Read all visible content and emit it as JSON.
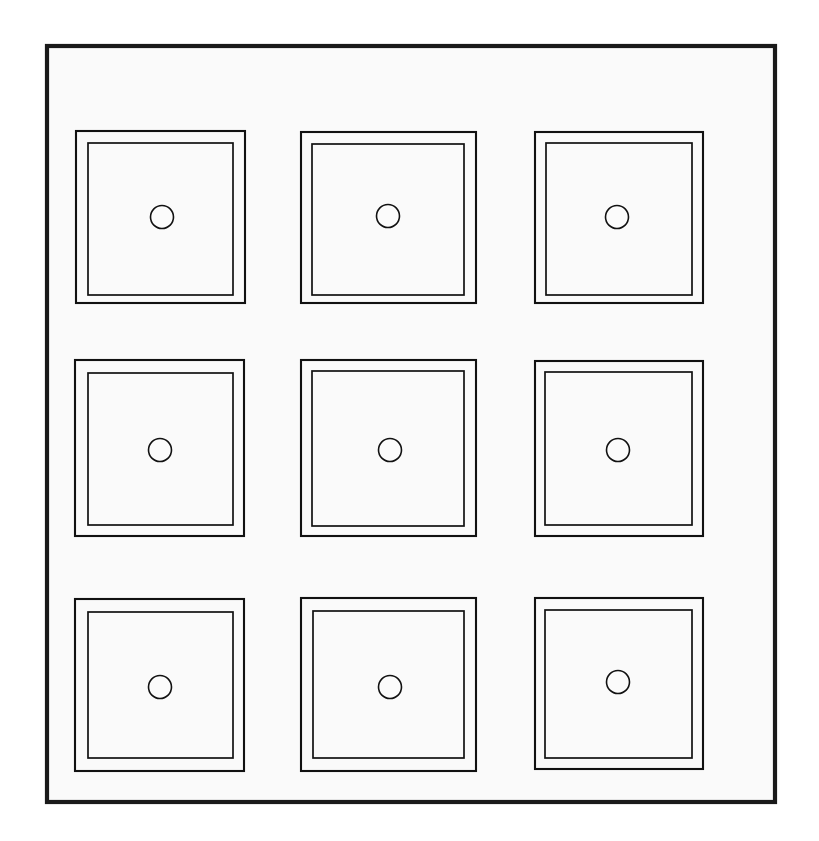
{
  "document": {
    "kind": "technical-line-drawing",
    "title": "Nine-panel grid line drawing",
    "canvas": {
      "width": 819,
      "height": 841
    },
    "background_color": "#ffffff",
    "ink_color": "#111111"
  },
  "frame": {
    "name": "outer-border",
    "x": 47,
    "y": 46,
    "width": 728,
    "height": 756,
    "stroke_width": 4.2,
    "fill_color": "#fafafa",
    "stroke_color": "#1a1a1a"
  },
  "grid": {
    "rows": 3,
    "columns": 3,
    "cell_count": 9,
    "outer_stroke_width": 2.1,
    "inner_stroke_width": 1.7,
    "hole_stroke_width": 1.6,
    "hole_radius": 11.5,
    "hole_fill_color": "#fbfbfb",
    "row_tops": [
      131,
      360,
      598
    ],
    "column_lefts": [
      76,
      301,
      535
    ]
  },
  "cells": [
    {
      "id": "cell-r1c1",
      "label": "row 1 column 1",
      "outer": {
        "x": 76,
        "y": 131,
        "width": 169,
        "height": 172
      },
      "inner": {
        "x": 88,
        "y": 143,
        "width": 145,
        "height": 152
      },
      "hole": {
        "cx": 162,
        "cy": 217,
        "r": 11.5
      }
    },
    {
      "id": "cell-r1c2",
      "label": "row 1 column 2",
      "outer": {
        "x": 301,
        "y": 132,
        "width": 175,
        "height": 171
      },
      "inner": {
        "x": 312,
        "y": 144,
        "width": 152,
        "height": 151
      },
      "hole": {
        "cx": 388,
        "cy": 216,
        "r": 11.5
      }
    },
    {
      "id": "cell-r1c3",
      "label": "row 1 column 3",
      "outer": {
        "x": 535,
        "y": 132,
        "width": 168,
        "height": 171
      },
      "inner": {
        "x": 546,
        "y": 143,
        "width": 146,
        "height": 152
      },
      "hole": {
        "cx": 617,
        "cy": 217,
        "r": 11.5
      }
    },
    {
      "id": "cell-r2c1",
      "label": "row 2 column 1",
      "outer": {
        "x": 75,
        "y": 360,
        "width": 169,
        "height": 176
      },
      "inner": {
        "x": 88,
        "y": 373,
        "width": 145,
        "height": 152
      },
      "hole": {
        "cx": 160,
        "cy": 450,
        "r": 11.5
      }
    },
    {
      "id": "cell-r2c2",
      "label": "row 2 column 2",
      "outer": {
        "x": 301,
        "y": 360,
        "width": 175,
        "height": 176
      },
      "inner": {
        "x": 312,
        "y": 371,
        "width": 152,
        "height": 155
      },
      "hole": {
        "cx": 390,
        "cy": 450,
        "r": 11.5
      }
    },
    {
      "id": "cell-r2c3",
      "label": "row 2 column 3",
      "outer": {
        "x": 535,
        "y": 361,
        "width": 168,
        "height": 175
      },
      "inner": {
        "x": 545,
        "y": 372,
        "width": 147,
        "height": 153
      },
      "hole": {
        "cx": 618,
        "cy": 450,
        "r": 11.5
      }
    },
    {
      "id": "cell-r3c1",
      "label": "row 3 column 1",
      "outer": {
        "x": 75,
        "y": 599,
        "width": 169,
        "height": 172
      },
      "inner": {
        "x": 88,
        "y": 612,
        "width": 145,
        "height": 146
      },
      "hole": {
        "cx": 160,
        "cy": 687,
        "r": 11.5
      }
    },
    {
      "id": "cell-r3c2",
      "label": "row 3 column 2",
      "outer": {
        "x": 301,
        "y": 598,
        "width": 175,
        "height": 173
      },
      "inner": {
        "x": 313,
        "y": 611,
        "width": 151,
        "height": 147
      },
      "hole": {
        "cx": 390,
        "cy": 687,
        "r": 11.5
      }
    },
    {
      "id": "cell-r3c3",
      "label": "row 3 column 3",
      "outer": {
        "x": 535,
        "y": 598,
        "width": 168,
        "height": 171
      },
      "inner": {
        "x": 545,
        "y": 610,
        "width": 147,
        "height": 148
      },
      "hole": {
        "cx": 618,
        "cy": 682,
        "r": 11.5
      }
    }
  ]
}
